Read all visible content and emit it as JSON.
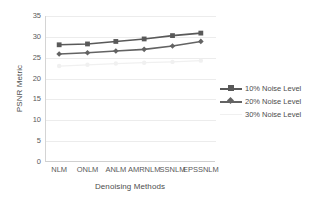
{
  "chart_data": {
    "type": "line",
    "title": "",
    "xlabel": "Denoising Methods",
    "ylabel": "PSNR Metric",
    "categories": [
      "NLM",
      "ONLM",
      "ANLM",
      "AMRNLM",
      "SSNLM",
      "EPSSNLM"
    ],
    "ylim": [
      0,
      35
    ],
    "yticks": [
      "0",
      "5",
      "10",
      "15",
      "20",
      "25",
      "30",
      "35"
    ],
    "grid": true,
    "legend_position": "right",
    "series": [
      {
        "name": "10% Noise Level",
        "marker": "square",
        "color": "#595959",
        "values": [
          28.1,
          28.3,
          28.9,
          29.5,
          30.3,
          30.9
        ]
      },
      {
        "name": "20% Noise Level",
        "marker": "diamond",
        "color": "#636363",
        "values": [
          25.9,
          26.2,
          26.6,
          27.0,
          27.8,
          28.9
        ]
      },
      {
        "name": "30% Noise Level",
        "marker": "circle",
        "color": "#f0f0f0",
        "values": [
          23.0,
          23.3,
          23.6,
          23.8,
          24.0,
          24.3
        ]
      }
    ]
  },
  "axis": {
    "y_title": "PSNR Metric",
    "x_title": "Denoising Methods"
  },
  "legend": {
    "items": [
      {
        "label": "10% Noise Level"
      },
      {
        "label": "20% Noise Level"
      },
      {
        "label": "30% Noise Level"
      }
    ]
  }
}
